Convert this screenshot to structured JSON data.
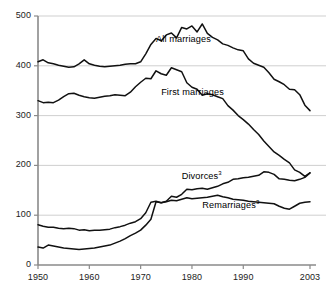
{
  "chart_data": {
    "type": "line",
    "title": "",
    "subtitle": "",
    "xlabel": "",
    "ylabel": "",
    "xlim": [
      1950,
      2003
    ],
    "ylim": [
      0,
      500
    ],
    "grid": true,
    "legend_position": "inline-annotations",
    "ytick_labels": [
      "0",
      "100",
      "200",
      "300",
      "400",
      "500"
    ],
    "yticks": [
      0,
      100,
      200,
      300,
      400,
      500
    ],
    "xtick_labels": [
      "1950",
      "1960",
      "1970",
      "1980",
      "1990",
      "2003"
    ],
    "xticks": [
      1950,
      1960,
      1970,
      1980,
      1990,
      2003
    ],
    "annotations": [
      {
        "text": "All marriages",
        "x": 1973,
        "y": 452
      },
      {
        "text": "First marriages",
        "x": 1974,
        "y": 345
      },
      {
        "text": "Divorces",
        "superscript": "3",
        "x": 1978,
        "y": 177
      },
      {
        "text": "Remarriages",
        "superscript": "3",
        "x": 1982,
        "y": 118
      }
    ],
    "x": [
      1950,
      1951,
      1952,
      1953,
      1954,
      1955,
      1956,
      1957,
      1958,
      1959,
      1960,
      1961,
      1962,
      1963,
      1964,
      1965,
      1966,
      1967,
      1968,
      1969,
      1970,
      1971,
      1972,
      1973,
      1974,
      1975,
      1976,
      1977,
      1978,
      1979,
      1980,
      1981,
      1982,
      1983,
      1984,
      1985,
      1986,
      1987,
      1988,
      1989,
      1990,
      1991,
      1992,
      1993,
      1994,
      1995,
      1996,
      1997,
      1998,
      1999,
      2000,
      2001,
      2002,
      2003
    ],
    "series": [
      {
        "name": "All marriages",
        "values": [
          408,
          412,
          406,
          404,
          401,
          399,
          397,
          398,
          404,
          412,
          404,
          401,
          399,
          398,
          399,
          400,
          401,
          403,
          404,
          404,
          408,
          424,
          443,
          455,
          450,
          462,
          466,
          456,
          477,
          474,
          480,
          468,
          484,
          465,
          457,
          452,
          444,
          441,
          436,
          432,
          430,
          414,
          405,
          401,
          397,
          386,
          373,
          368,
          362,
          353,
          352,
          342,
          321,
          310
        ]
      },
      {
        "name": "First marriages",
        "values": [
          330,
          326,
          327,
          326,
          331,
          338,
          344,
          345,
          341,
          338,
          336,
          335,
          337,
          339,
          340,
          342,
          341,
          340,
          347,
          358,
          367,
          375,
          374,
          390,
          384,
          381,
          396,
          392,
          388,
          366,
          357,
          353,
          341,
          344,
          342,
          338,
          334,
          320,
          311,
          300,
          292,
          283,
          272,
          262,
          249,
          238,
          227,
          220,
          212,
          205,
          191,
          186,
          178,
          185
        ]
      },
      {
        "name": "Divorces",
        "values": [
          81,
          78,
          76,
          76,
          74,
          73,
          74,
          73,
          70,
          71,
          69,
          70,
          70,
          71,
          72,
          75,
          77,
          80,
          84,
          87,
          93,
          105,
          126,
          128,
          125,
          128,
          138,
          136,
          142,
          152,
          151,
          153,
          154,
          152,
          155,
          158,
          163,
          166,
          172,
          173,
          175,
          176,
          178,
          180,
          187,
          186,
          182,
          173,
          172,
          170,
          169,
          172,
          176,
          185
        ]
      },
      {
        "name": "Remarriages",
        "values": [
          36,
          34,
          40,
          38,
          36,
          34,
          33,
          32,
          31,
          32,
          33,
          34,
          36,
          38,
          40,
          44,
          48,
          53,
          59,
          64,
          70,
          80,
          92,
          127,
          125,
          127,
          130,
          129,
          132,
          135,
          133,
          134,
          135,
          136,
          138,
          140,
          137,
          135,
          132,
          131,
          130,
          128,
          127,
          126,
          125,
          124,
          123,
          118,
          114,
          112,
          118,
          124,
          126,
          127
        ]
      }
    ]
  }
}
